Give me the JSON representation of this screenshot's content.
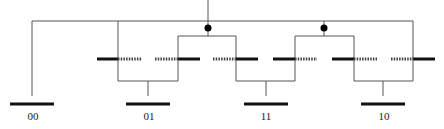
{
  "diagram": {
    "type": "tree-switch-network",
    "colors": {
      "wire": "#555555",
      "solid_segment": "#111111",
      "dotted_segment": "#444444",
      "junction_dot": "#000000",
      "label": "#222222"
    },
    "top_bus": {
      "y": 21,
      "x1": 32,
      "x2": 413
    },
    "input_stem": {
      "x": 208,
      "y1": 0,
      "y2": 21
    },
    "junctions": [
      {
        "id": "j1",
        "x": 208,
        "y": 28
      },
      {
        "id": "j2",
        "x": 324,
        "y": 28
      }
    ],
    "sub_brackets": [
      {
        "from_junction": "j1",
        "y": 36,
        "x1": 177,
        "x2": 237
      },
      {
        "from_junction": "j2",
        "y": 36,
        "x1": 295,
        "x2": 353
      }
    ],
    "switch_row_y": 59,
    "switch_pairs": [
      {
        "left": {
          "solid": [
            97,
            118
          ],
          "dotted": [
            118,
            142
          ],
          "tap_x": 118
        },
        "right": {
          "dotted": [
            155,
            178
          ],
          "solid": [
            178,
            200
          ],
          "tap_x": 178
        },
        "bracket": {
          "y": 81,
          "x1": 118,
          "x2": 178
        },
        "stem": {
          "x": 148,
          "y1": 81,
          "y2": 93
        }
      },
      {
        "left": {
          "dotted": [
            213,
            236
          ],
          "solid": [
            236,
            258
          ],
          "tap_x": 236
        },
        "right": {
          "solid": [
            273,
            295
          ],
          "dotted": [
            295,
            317
          ],
          "tap_x": 295
        },
        "bracket": {
          "y": 81,
          "x1": 236,
          "x2": 295
        },
        "stem": {
          "x": 266,
          "y1": 81,
          "y2": 93
        }
      },
      {
        "left": {
          "solid": [
            332,
            354
          ],
          "dotted": [
            354,
            377
          ],
          "tap_x": 354
        },
        "right": {
          "dotted": [
            391,
            413
          ],
          "solid": [
            413,
            435
          ],
          "tap_x": 413
        },
        "bracket": {
          "y": 81,
          "x1": 354,
          "x2": 413
        },
        "stem": {
          "x": 383,
          "y1": 81,
          "y2": 93
        }
      }
    ],
    "outputs": [
      {
        "label": "00",
        "x1": 10,
        "x2": 54,
        "cx": 32
      },
      {
        "label": "01",
        "x1": 126,
        "x2": 170,
        "cx": 148
      },
      {
        "label": "11",
        "x1": 244,
        "x2": 288,
        "cx": 266
      },
      {
        "label": "10",
        "x1": 361,
        "x2": 405,
        "cx": 383
      }
    ],
    "output_bar_y": 104,
    "label_y": 120
  }
}
